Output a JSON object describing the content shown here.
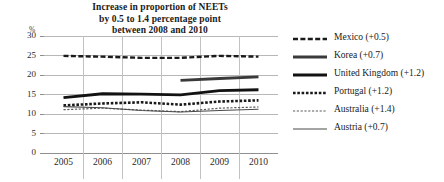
{
  "chart_data": {
    "type": "line",
    "title": "Increase in proportion of NEETs by 0.5 to 1.4 percentage point between 2008 and 2010",
    "title_lines": [
      "Increase in proportion of NEETs",
      "by 0.5 to 1.4 percentage point",
      "between 2008 and 2010"
    ],
    "xlabel": "",
    "ylabel": "%",
    "y_unit": "%",
    "categories": [
      "2005",
      "2006",
      "2007",
      "2008",
      "2009",
      "2010"
    ],
    "x": [
      2005,
      2006,
      2007,
      2008,
      2009,
      2010
    ],
    "yticks": [
      "30",
      "25",
      "20",
      "15",
      "10",
      "5",
      "0"
    ],
    "ytick_values": [
      30,
      25,
      20,
      15,
      10,
      5,
      0
    ],
    "ylim": [
      0,
      30
    ],
    "xlim": [
      2005,
      2010
    ],
    "grid": "horizontal-and-vertical-separators",
    "legend_position": "right",
    "series": [
      {
        "name": "Mexico (+0.5)",
        "country": "Mexico",
        "change": "+0.5",
        "style": "thick-dashed",
        "color": "#1a1a1a",
        "values": [
          24.9,
          24.7,
          24.4,
          24.4,
          24.9,
          24.7
        ]
      },
      {
        "name": "Korea (+0.7)",
        "country": "Korea",
        "change": "+0.7",
        "style": "thick-solid",
        "color": "#3a3a3a",
        "values": [
          null,
          null,
          null,
          18.6,
          19.1,
          19.5
        ]
      },
      {
        "name": "United Kingdom (+1.2)",
        "country": "United Kingdom",
        "change": "+1.2",
        "style": "extra-thick-solid",
        "color": "#121212",
        "values": [
          14.2,
          15.2,
          15.1,
          14.9,
          16.0,
          16.2
        ]
      },
      {
        "name": "Portugal (+1.2)",
        "country": "Portugal",
        "change": "+1.2",
        "style": "thick-dotted",
        "color": "#1a1a1a",
        "values": [
          12.2,
          12.7,
          13.0,
          12.4,
          13.2,
          13.5
        ]
      },
      {
        "name": "Australia (+1.4)",
        "country": "Australia",
        "change": "+1.4",
        "style": "thin-dotted",
        "color": "#5a5a5a",
        "values": [
          11.1,
          11.5,
          11.0,
          10.6,
          11.5,
          11.8
        ]
      },
      {
        "name": "Austria (+0.7)",
        "country": "Austria",
        "change": "+0.7",
        "style": "thin-solid",
        "color": "#4a4a4a",
        "values": [
          11.9,
          11.6,
          10.9,
          10.5,
          10.9,
          11.2
        ]
      }
    ]
  },
  "legend": {
    "items": [
      {
        "label": "Mexico (+0.5)"
      },
      {
        "label": "Korea (+0.7)"
      },
      {
        "label": "United Kingdom (+1.2)"
      },
      {
        "label": "Portugal (+1.2)"
      },
      {
        "label": "Australia (+1.4)"
      },
      {
        "label": "Austria (+0.7)"
      }
    ]
  }
}
